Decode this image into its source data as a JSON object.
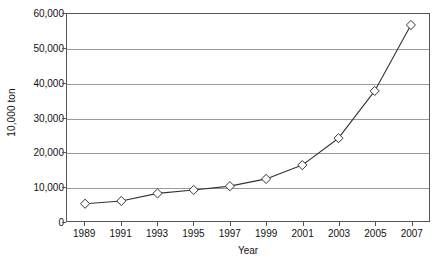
{
  "chart_data": {
    "type": "line",
    "title": "",
    "subtitle": "",
    "xlabel": "Year",
    "ylabel": "10,000 ton",
    "categories": [
      "1989",
      "1991",
      "1993",
      "1995",
      "1997",
      "1999",
      "2001",
      "2003",
      "2005",
      "2007"
    ],
    "x": [
      1989,
      1991,
      1993,
      1995,
      1997,
      1999,
      2001,
      2003,
      2005,
      2007
    ],
    "values": [
      5000,
      5800,
      8000,
      9000,
      10100,
      12200,
      16200,
      24000,
      37700,
      56800
    ],
    "series": [
      {
        "name": "",
        "values": [
          5000,
          5800,
          8000,
          9000,
          10100,
          12200,
          16200,
          24000,
          37700,
          56800
        ]
      }
    ],
    "ylim": [
      0,
      60000
    ],
    "xlim": [
      1988,
      2008
    ],
    "ytick_labels": [
      "0",
      "10,000",
      "20,000",
      "30,000",
      "40,000",
      "50,000",
      "60,000"
    ],
    "ytick_values": [
      0,
      10000,
      20000,
      30000,
      40000,
      50000,
      60000
    ],
    "xtick_labels": [
      "1989",
      "1991",
      "1993",
      "1995",
      "1997",
      "1999",
      "2001",
      "2003",
      "2005",
      "2007"
    ],
    "grid": "horizontal",
    "legend": "none",
    "marker": "open-diamond",
    "line_color": "#333333",
    "marker_fill_color": "#ffffff",
    "marker_edge_color": "#333333",
    "gridline_color": "#9a9a9a",
    "axis_color": "#555555",
    "background_color": "#ffffff"
  }
}
